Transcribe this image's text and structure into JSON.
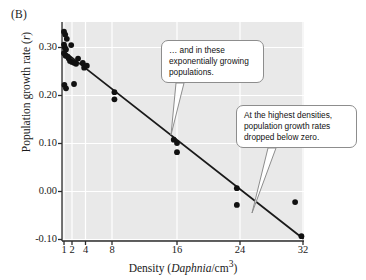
{
  "panel": {
    "label": "(B)"
  },
  "chart_data": {
    "type": "scatter",
    "title": "",
    "xlabel": "Density (Daphnia/cm3)",
    "xlabel_parts": {
      "pre": "Density (",
      "italic": "Daphnia",
      "mid": "/cm",
      "sup": "3",
      "post": ")"
    },
    "ylabel": "Population growth rate (r)",
    "ylabel_parts": {
      "pre": "Population growth rate (",
      "italic": "r",
      "post": ")"
    },
    "xticks": [
      1,
      2,
      4,
      8,
      16,
      24,
      32
    ],
    "xtick_labels": [
      "1",
      "2",
      "4",
      "8",
      "16",
      "24",
      "32"
    ],
    "yticks": [
      -0.1,
      0.0,
      0.1,
      0.2,
      0.3
    ],
    "ytick_labels": [
      "-0.10",
      "0.00",
      "0.10",
      "0.20",
      "0.30"
    ],
    "ylim": [
      -0.115,
      0.345
    ],
    "grid": true,
    "grid_color": "#ffffff",
    "plot_background": "#e9e9e9",
    "point_color": "#111111",
    "line_color": "#1a1a1a",
    "series": [
      {
        "name": "Population growth rate vs density",
        "points": [
          [
            1.0,
            0.333
          ],
          [
            1.15,
            0.327
          ],
          [
            1.35,
            0.318
          ],
          [
            1.0,
            0.306
          ],
          [
            1.1,
            0.3
          ],
          [
            1.25,
            0.296
          ],
          [
            1.0,
            0.288
          ],
          [
            1.2,
            0.283
          ],
          [
            1.45,
            0.281
          ],
          [
            1.9,
            0.305
          ],
          [
            1.6,
            0.277
          ],
          [
            1.75,
            0.272
          ],
          [
            2.0,
            0.27
          ],
          [
            2.3,
            0.268
          ],
          [
            2.6,
            0.266
          ],
          [
            2.9,
            0.277
          ],
          [
            1.05,
            0.222
          ],
          [
            1.25,
            0.215
          ],
          [
            2.3,
            0.224
          ],
          [
            3.6,
            0.268
          ],
          [
            3.8,
            0.258
          ],
          [
            4.2,
            0.262
          ],
          [
            8.3,
            0.207
          ],
          [
            8.3,
            0.192
          ],
          [
            15.6,
            0.108
          ],
          [
            16.0,
            0.101
          ],
          [
            16.0,
            0.082
          ],
          [
            23.6,
            0.007
          ],
          [
            23.6,
            -0.028
          ],
          [
            31.0,
            -0.022
          ],
          [
            31.8,
            -0.093
          ]
        ]
      }
    ],
    "trendline": {
      "name": "linear regression",
      "x_start": 1.0,
      "y_start": 0.292,
      "x_end": 32.0,
      "y_end": -0.098
    }
  },
  "callouts": [
    {
      "id": "growth",
      "line1": "… and in these",
      "line2": "exponentially growing",
      "line3": "populations."
    },
    {
      "id": "density",
      "line1": "At the highest densities,",
      "line2": "population growth rates",
      "line3": "dropped below zero."
    }
  ]
}
